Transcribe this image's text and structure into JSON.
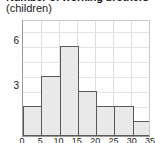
{
  "chart_data": {
    "type": "bar",
    "title": "Number of working brothers",
    "subtitle": "(children)",
    "xlabel": "",
    "ylabel": "",
    "categories": [
      "0",
      "5",
      "10",
      "15",
      "20",
      "25",
      "30"
    ],
    "bin_edges": [
      "0",
      "5",
      "10",
      "15",
      "20",
      "25",
      "30",
      "35"
    ],
    "values": [
      2,
      4,
      6,
      3,
      2,
      2,
      1
    ],
    "ylim": [
      0,
      7
    ],
    "yticks": [
      "3",
      "6"
    ],
    "ytick_values": [
      3,
      6
    ],
    "xticks": [
      "0",
      "5",
      "10",
      "15",
      "20",
      "25",
      "30",
      "35"
    ],
    "grid": true,
    "legend": "none",
    "bar_fill_color": "#e9e9e9",
    "bar_edge_color": "#595959",
    "grid_color": "#dedede",
    "axis_color": "#9a9a9a",
    "background_color": "#ffffff",
    "text_color": "#1a1a1a"
  },
  "chart": {
    "title_line1": "Number of working brothers",
    "title_line2": "(children)"
  }
}
